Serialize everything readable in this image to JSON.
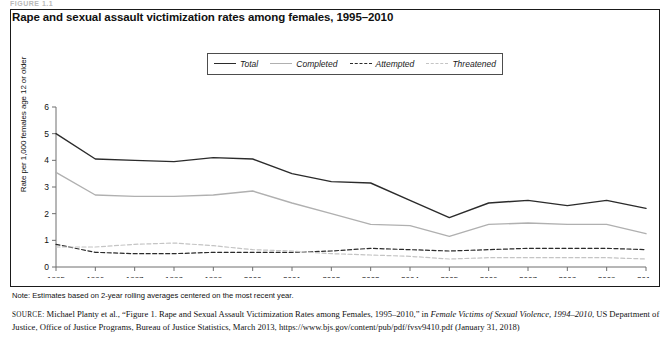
{
  "figure_label": "FIGURE 1.1",
  "chart_title": "Rape and sexual assault victimization rates among females, 1995–2010",
  "note": "Note: Estimates based on 2-year rolling averages centered on the most recent year.",
  "source": {
    "prefix": "SOURCE:",
    "text_1": " Michael Planty et al., “Figure 1. Rape and Sexual Assault Victimization Rates among Females, 1995–2010,” in ",
    "italic_1": "Female Victims of Sexual Violence, 1994–2010",
    "text_2": ", US Department of Justice, Office of Justice Programs, Bureau of Justice Statistics, March 2013, https://www.bjs.gov/content/pub/pdf/fvsv9410.pdf (January 31, 2018)"
  },
  "colors": {
    "total": "#2b2b2b",
    "completed": "#b0b0b0",
    "attempted": "#2b2b2b",
    "threatened": "#c4c4c4",
    "axis": "#6e6e6e",
    "border": "#1a1a1a"
  },
  "chart_data": {
    "type": "line",
    "title": "Rape and sexual assault victimization rates among females, 1995–2010",
    "xlabel": "",
    "ylabel": "Rate per 1,000 females age 12 or older",
    "ylim": [
      0,
      6
    ],
    "yticks": [
      0,
      1,
      2,
      3,
      4,
      5,
      6
    ],
    "grid": false,
    "legend_position": "top-center",
    "categories": [
      "1995",
      "1996",
      "1997",
      "1998",
      "1999",
      "2000",
      "2001",
      "2002",
      "2003",
      "2004",
      "2005",
      "2006",
      "2007",
      "2008",
      "2009",
      "2010"
    ],
    "series": [
      {
        "name": "Total",
        "style": "solid",
        "color": "#2b2b2b",
        "values": [
          5.0,
          4.05,
          4.0,
          3.95,
          4.1,
          4.05,
          3.5,
          3.2,
          3.15,
          2.5,
          1.85,
          2.4,
          2.5,
          2.3,
          2.5,
          2.2
        ]
      },
      {
        "name": "Completed",
        "style": "solid",
        "color": "#b0b0b0",
        "values": [
          3.55,
          2.7,
          2.65,
          2.65,
          2.7,
          2.85,
          2.4,
          2.0,
          1.6,
          1.55,
          1.15,
          1.6,
          1.65,
          1.6,
          1.6,
          1.25
        ]
      },
      {
        "name": "Attempted",
        "style": "dashed",
        "color": "#2b2b2b",
        "values": [
          0.85,
          0.55,
          0.5,
          0.5,
          0.55,
          0.55,
          0.55,
          0.6,
          0.7,
          0.65,
          0.6,
          0.65,
          0.7,
          0.7,
          0.7,
          0.65
        ]
      },
      {
        "name": "Threatened",
        "style": "dashed",
        "color": "#c4c4c4",
        "values": [
          0.75,
          0.75,
          0.85,
          0.9,
          0.8,
          0.65,
          0.6,
          0.5,
          0.45,
          0.4,
          0.3,
          0.35,
          0.35,
          0.35,
          0.35,
          0.3
        ]
      }
    ]
  }
}
